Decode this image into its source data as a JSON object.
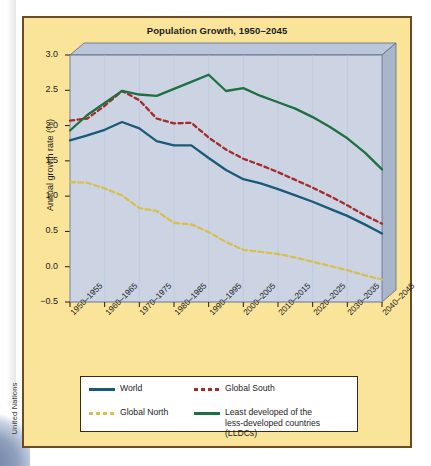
{
  "source": {
    "credit": "United Nations"
  },
  "figure": {
    "title": "Population Growth, 1950–2045",
    "frame_color": "#6b4a24",
    "background_color": "#f9e49a",
    "plot_background_color": "#ccd4e4"
  },
  "axes": {
    "ylabel": "Annual growth rate (%)",
    "yticks": [
      "3.0",
      "2.5",
      "2.0",
      "1.5",
      "1.0",
      "0.5",
      "0.0",
      "−0.5"
    ],
    "xticks": [
      "1950–1955",
      "1960–1965",
      "1970–1975",
      "1980–1985",
      "1990–1995",
      "2000–2005",
      "2010–2015",
      "2020–2025",
      "2030–2035",
      "2040–2045"
    ]
  },
  "legend": {
    "items": [
      {
        "label": "World",
        "color": "#1a5a78",
        "style": "solid"
      },
      {
        "label": "Global South",
        "color": "#a52a2a",
        "style": "dashed"
      },
      {
        "label": "Global North",
        "color": "#d6c054",
        "style": "dashed"
      },
      {
        "label": "Least developed of the",
        "label2": "less-developed countries (LLDCs)",
        "color": "#1e7040",
        "style": "solid"
      }
    ]
  },
  "chart_data": {
    "type": "line",
    "title": "Population Growth, 1950–2045",
    "xlabel": "",
    "ylabel": "Annual growth rate (%)",
    "ylim": [
      -0.5,
      3.0
    ],
    "ytick_step": 0.5,
    "grid": false,
    "legend_position": "bottom",
    "categories": [
      "1950–1955",
      "1955–1960",
      "1960–1965",
      "1965–1970",
      "1970–1975",
      "1975–1980",
      "1980–1985",
      "1985–1990",
      "1990–1995",
      "1995–2000",
      "2000–2005",
      "2005–2010",
      "2010–2015",
      "2015–2020",
      "2020–2025",
      "2025–2030",
      "2030–2035",
      "2035–2040",
      "2040–2045"
    ],
    "x_axis_tick_labels": [
      "1950–1955",
      "1960–1965",
      "1970–1975",
      "1980–1985",
      "1990–1995",
      "2000–2005",
      "2010–2015",
      "2020–2025",
      "2030–2035",
      "2040–2045"
    ],
    "series": [
      {
        "name": "World",
        "color": "#1a5a78",
        "style": "solid",
        "values": [
          1.79,
          1.86,
          1.94,
          2.05,
          1.96,
          1.78,
          1.72,
          1.72,
          1.54,
          1.37,
          1.24,
          1.18,
          1.1,
          1.01,
          0.92,
          0.82,
          0.72,
          0.6,
          0.47
        ]
      },
      {
        "name": "Global South",
        "color": "#a52a2a",
        "style": "dashed",
        "values": [
          2.07,
          2.1,
          2.28,
          2.49,
          2.36,
          2.1,
          2.03,
          2.04,
          1.83,
          1.66,
          1.53,
          1.44,
          1.34,
          1.23,
          1.12,
          1.0,
          0.87,
          0.73,
          0.61
        ]
      },
      {
        "name": "Global North",
        "color": "#d6c054",
        "style": "dashed",
        "values": [
          1.2,
          1.19,
          1.11,
          1.01,
          0.83,
          0.79,
          0.62,
          0.6,
          0.49,
          0.35,
          0.24,
          0.21,
          0.18,
          0.13,
          0.07,
          0.01,
          -0.05,
          -0.12,
          -0.18
        ]
      },
      {
        "name": "Least developed of the less-developed countries (LLDCs)",
        "color": "#1e7040",
        "style": "solid",
        "values": [
          1.93,
          2.15,
          2.32,
          2.49,
          2.44,
          2.42,
          2.52,
          2.62,
          2.72,
          2.49,
          2.53,
          2.42,
          2.33,
          2.24,
          2.12,
          1.98,
          1.82,
          1.62,
          1.38
        ]
      }
    ]
  }
}
